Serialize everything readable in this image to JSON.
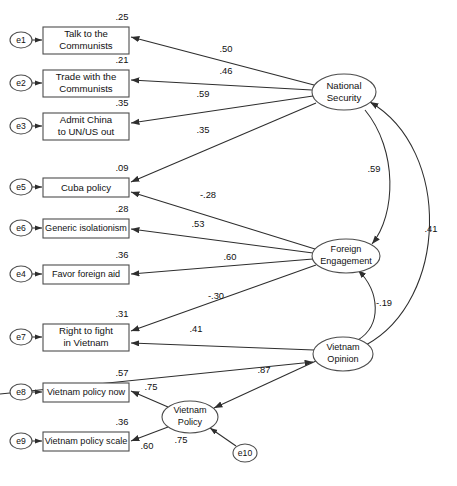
{
  "diagram": {
    "type": "sem-path-diagram",
    "observed_variables": [
      {
        "id": "talk-communists",
        "label_line1": "Talk to the",
        "label_line2": "Communists",
        "r2": ".25",
        "error": "e1",
        "x": 43,
        "y": 27,
        "w": 86,
        "h": 27
      },
      {
        "id": "trade-communists",
        "label_line1": "Trade with the",
        "label_line2": "Communists",
        "r2": ".21",
        "error": "e2",
        "x": 43,
        "y": 70,
        "w": 86,
        "h": 27
      },
      {
        "id": "admit-china",
        "label_line1": "Admit China",
        "label_line2": "to UN/US out",
        "r2": ".35",
        "error": "e3",
        "x": 43,
        "y": 113,
        "w": 86,
        "h": 27
      },
      {
        "id": "cuba-policy",
        "label_line1": "Cuba policy",
        "label_line2": "",
        "r2": ".09",
        "error": "e5",
        "x": 43,
        "y": 178,
        "w": 86,
        "h": 19
      },
      {
        "id": "generic-isolationism",
        "label_line1": "Generic isolationism",
        "label_line2": "",
        "r2": ".28",
        "error": "e6",
        "x": 43,
        "y": 219,
        "w": 86,
        "h": 19
      },
      {
        "id": "favor-foreign-aid",
        "label_line1": "Favor foreign aid",
        "label_line2": "",
        "r2": ".36",
        "error": "e4",
        "x": 43,
        "y": 265,
        "w": 86,
        "h": 19
      },
      {
        "id": "right-to-fight",
        "label_line1": "Right to fight",
        "label_line2": "in Vietnam",
        "r2": ".31",
        "error": "e7",
        "x": 43,
        "y": 324,
        "w": 86,
        "h": 27
      },
      {
        "id": "vietnam-policy-now",
        "label_line1": "Vietnam policy now",
        "label_line2": "",
        "r2": ".57",
        "error": "e8",
        "x": 43,
        "y": 383,
        "w": 86,
        "h": 19
      },
      {
        "id": "vietnam-policy-scale",
        "label_line1": "Vietnam policy scale",
        "label_line2": "",
        "r2": ".36",
        "error": "e9",
        "x": 43,
        "y": 432,
        "w": 86,
        "h": 19
      }
    ],
    "latent_variables": [
      {
        "id": "national-security",
        "label_line1": "National",
        "label_line2": "Security",
        "cx": 344,
        "cy": 92,
        "rx": 32,
        "ry": 18
      },
      {
        "id": "foreign-engagement",
        "label_line1": "Foreign",
        "label_line2": "Engagement",
        "cx": 346,
        "cy": 256,
        "rx": 34,
        "ry": 17
      },
      {
        "id": "vietnam-opinion",
        "label_line1": "Vietnam",
        "label_line2": "Opinion",
        "cx": 343,
        "cy": 354,
        "rx": 30,
        "ry": 17
      },
      {
        "id": "vietnam-policy",
        "label_line1": "Vietnam",
        "label_line2": "Policy",
        "cx": 190,
        "cy": 417,
        "rx": 28,
        "ry": 16
      }
    ],
    "error_terms": [
      {
        "id": "e1",
        "label": "e1",
        "cx": 21,
        "cy": 40
      },
      {
        "id": "e2",
        "label": "e2",
        "cx": 21,
        "cy": 83
      },
      {
        "id": "e3",
        "label": "e3",
        "cx": 21,
        "cy": 126
      },
      {
        "id": "e5",
        "label": "e5",
        "cx": 21,
        "cy": 187
      },
      {
        "id": "e6",
        "label": "e6",
        "cx": 21,
        "cy": 228
      },
      {
        "id": "e4",
        "label": "e4",
        "cx": 21,
        "cy": 274
      },
      {
        "id": "e7",
        "label": "e7",
        "cx": 21,
        "cy": 337
      },
      {
        "id": "e8",
        "label": "e8",
        "cx": 21,
        "cy": 392
      },
      {
        "id": "e9",
        "label": "e9",
        "cx": 21,
        "cy": 441
      },
      {
        "id": "e10",
        "label": "e10",
        "cx": 245,
        "cy": 453
      }
    ],
    "path_coefficients": [
      {
        "id": "ns-talk",
        "value": ".50",
        "x": 226,
        "y": 50,
        "from": "national-security",
        "to": "talk-communists"
      },
      {
        "id": "ns-trade",
        "value": ".46",
        "x": 226,
        "y": 72,
        "from": "national-security",
        "to": "trade-communists"
      },
      {
        "id": "ns-admit",
        "value": ".59",
        "x": 203,
        "y": 95,
        "from": "national-security",
        "to": "admit-china"
      },
      {
        "id": "ns-cuba",
        "value": ".35",
        "x": 203,
        "y": 131,
        "from": "national-security",
        "to": "cuba-policy"
      },
      {
        "id": "fe-cuba",
        "value": "-.28",
        "x": 208,
        "y": 196,
        "from": "foreign-engagement",
        "to": "cuba-policy"
      },
      {
        "id": "fe-isolationism",
        "value": ".53",
        "x": 198,
        "y": 225,
        "from": "foreign-engagement",
        "to": "generic-isolationism"
      },
      {
        "id": "fe-aid",
        "value": ".60",
        "x": 230,
        "y": 258,
        "from": "foreign-engagement",
        "to": "favor-foreign-aid"
      },
      {
        "id": "fe-fight",
        "value": "-.30",
        "x": 216,
        "y": 297,
        "from": "foreign-engagement",
        "to": "right-to-fight"
      },
      {
        "id": "vo-fight",
        "value": ".41",
        "x": 196,
        "y": 330,
        "from": "vietnam-opinion",
        "to": "right-to-fight"
      },
      {
        "id": "ns-fe",
        "value": ".59",
        "x": 374,
        "y": 170,
        "from": "national-security",
        "to": "foreign-engagement"
      },
      {
        "id": "vo-ns",
        "value": ".41",
        "x": 431,
        "y": 230,
        "from": "vietnam-opinion",
        "to": "national-security"
      },
      {
        "id": "vo-fe",
        "value": "-.19",
        "x": 384,
        "y": 304,
        "from": "vietnam-opinion",
        "to": "foreign-engagement"
      },
      {
        "id": "vp-vo",
        "value": ".87",
        "x": 264,
        "y": 371,
        "from": "vietnam-policy",
        "to": "vietnam-opinion"
      },
      {
        "id": "vp-now",
        "value": ".75",
        "x": 151,
        "y": 388,
        "from": "vietnam-policy",
        "to": "vietnam-policy-now"
      },
      {
        "id": "vp-scale",
        "value": ".60",
        "x": 147,
        "y": 447,
        "from": "vietnam-policy",
        "to": "vietnam-policy-scale"
      },
      {
        "id": "vp-r2",
        "value": ".75",
        "x": 181,
        "y": 441,
        "from": "e10",
        "to": "vietnam-policy"
      }
    ],
    "colors": {
      "stroke": "#2e2e2e",
      "node_stroke": "#4d4d4d",
      "background": "#ffffff",
      "text": "#111111"
    }
  }
}
